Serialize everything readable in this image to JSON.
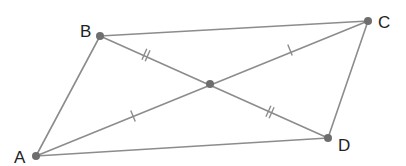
{
  "figure": {
    "type": "parallelogram-with-diagonals",
    "colors": {
      "line": "#8c8c8c",
      "vertex": "#6e6e6e",
      "label": "#222222",
      "background": "#ffffff"
    },
    "vertices": [
      {
        "name": "A",
        "x": 36,
        "y": 156,
        "label_x": 14,
        "label_y": 163
      },
      {
        "name": "B",
        "x": 100,
        "y": 36,
        "label_x": 80,
        "label_y": 37
      },
      {
        "name": "C",
        "x": 368,
        "y": 21,
        "label_x": 378,
        "label_y": 28
      },
      {
        "name": "D",
        "x": 328,
        "y": 138,
        "label_x": 338,
        "label_y": 151
      }
    ],
    "center": {
      "name": "",
      "x": 210,
      "y": 84
    },
    "sides": [
      {
        "from": "A",
        "to": "B"
      },
      {
        "from": "B",
        "to": "C"
      },
      {
        "from": "C",
        "to": "D"
      },
      {
        "from": "D",
        "to": "A"
      }
    ],
    "diagonals": [
      {
        "from": "A",
        "to": "C"
      },
      {
        "from": "B",
        "to": "D"
      }
    ],
    "tick_marks": [
      {
        "segment": "BO",
        "count": 2,
        "x": 146,
        "y": 55
      },
      {
        "segment": "OD",
        "count": 2,
        "x": 270,
        "y": 112
      },
      {
        "segment": "AO",
        "count": 1,
        "x": 133,
        "y": 116
      },
      {
        "segment": "OC",
        "count": 1,
        "x": 290,
        "y": 50
      }
    ],
    "labels": {
      "A": "A",
      "B": "B",
      "C": "C",
      "D": "D"
    }
  }
}
